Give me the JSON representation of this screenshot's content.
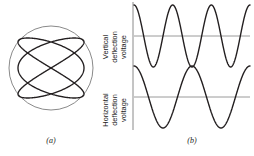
{
  "figure": {
    "panels": [
      {
        "id": "a",
        "caption": "(a)",
        "name": "crt-screen-lissajous",
        "screen": {
          "shape": "circle",
          "cx": 51,
          "cy": 68,
          "r": 42,
          "stroke": "#8a8a8a"
        },
        "curve": {
          "type": "lissajous",
          "ratio_x": 3,
          "ratio_y": 2,
          "amplitude_x": 33,
          "amplitude_y": 30,
          "phase_deg": 90,
          "stroke": "#231f20",
          "stroke_width": 1.35
        }
      },
      {
        "id": "b",
        "caption": "(b)",
        "name": "deflection-voltage-waveforms",
        "axis": {
          "x": 133,
          "y_top": 2,
          "y_bottom": 130,
          "stroke": "#8a8a8a"
        },
        "waveforms": [
          {
            "name": "vertical-deflection-waveform",
            "label_lines": [
              "Vertical",
              "deflection",
              "voltage"
            ],
            "cycles": 3,
            "baseline_y": 36,
            "amplitude": 31,
            "phase": "cosine",
            "x_start": 134,
            "x_end": 250,
            "stroke": "#231f20",
            "baseline_stroke": "#9a9a9a"
          },
          {
            "name": "horizontal-deflection-waveform",
            "label_lines": [
              "Horizontal",
              "deflection",
              "voltage"
            ],
            "cycles": 2,
            "baseline_y": 97,
            "amplitude": 31,
            "phase": "cosine",
            "x_start": 134,
            "x_end": 250,
            "stroke": "#231f20",
            "baseline_stroke": "#9a9a9a"
          }
        ]
      }
    ]
  },
  "chart_data": {
    "type": "line",
    "title": "",
    "xlabel": "",
    "ylabel": "",
    "series": [
      {
        "name": "Vertical deflection voltage",
        "waveform": "cosine",
        "cycles": 3,
        "amplitude": 1,
        "phase_deg": 0,
        "x_range": [
          0,
          1
        ],
        "ylim": [
          -1,
          1
        ]
      },
      {
        "name": "Horizontal deflection voltage",
        "waveform": "cosine",
        "cycles": 2,
        "amplitude": 1,
        "phase_deg": 0,
        "x_range": [
          0,
          1
        ],
        "ylim": [
          -1,
          1
        ]
      }
    ],
    "lissajous": {
      "frequency_ratio": "3:2",
      "x_expression": "sin(3t + 90deg)",
      "y_expression": "sin(2t)",
      "horizontal_lobes": 3,
      "vertical_lobes": 2
    },
    "grid": false,
    "legend": "none"
  }
}
